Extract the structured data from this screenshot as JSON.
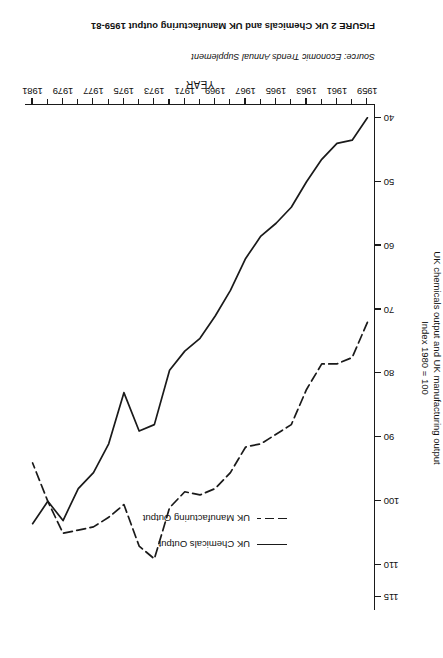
{
  "figure": {
    "source_label": "Source:",
    "source_text": "Economic Trends Annual Supplement",
    "caption": "FIGURE 2  UK Chemicals and UK Manufacturing output 1959-81"
  },
  "legend": {
    "items": [
      {
        "label": "UK Chemicals Output",
        "style": "solid"
      },
      {
        "label": "UK Manufacturing Output",
        "style": "dashed"
      }
    ]
  },
  "axes": {
    "x_title": "YEAR",
    "y_title_line1": "UK chemicals output and UK manufacturing output",
    "y_title_line2": "Index 1980 = 100",
    "y_ticks": [
      "40",
      "50",
      "60",
      "70",
      "80",
      "90",
      "100",
      "110",
      "115"
    ],
    "x_ticks": [
      "1959",
      "1961",
      "1963",
      "1965",
      "1967",
      "1969",
      "1971",
      "1973",
      "1975",
      "1977",
      "1979",
      "1981"
    ]
  },
  "chart_data": {
    "type": "line",
    "title": "UK Chemicals and UK Manufacturing output 1959-81",
    "xlabel": "YEAR",
    "ylabel": "UK chemicals output and UK manufacturing output, Index 1980 = 100",
    "xlim": [
      1958.5,
      1981.5
    ],
    "ylim": [
      38,
      117
    ],
    "grid": false,
    "legend_position": "upper-left-inside",
    "x": [
      1959,
      1960,
      1961,
      1962,
      1963,
      1964,
      1965,
      1966,
      1967,
      1968,
      1969,
      1970,
      1971,
      1972,
      1973,
      1974,
      1975,
      1976,
      1977,
      1978,
      1979,
      1980,
      1981
    ],
    "series": [
      {
        "name": "UK Chemicals Output",
        "style": "solid",
        "color": "#1a1a1a",
        "values": [
          40.0,
          43.5,
          44.0,
          46.5,
          50.0,
          54.0,
          56.5,
          58.5,
          62.0,
          67.0,
          71.0,
          74.5,
          76.5,
          79.5,
          88.0,
          89.0,
          83.0,
          91.0,
          95.5,
          98.0,
          103.0,
          100.0,
          103.5
        ]
      },
      {
        "name": "UK Manufacturing Output",
        "style": "dashed",
        "color": "#1a1a1a",
        "values": [
          72.0,
          77.5,
          78.5,
          78.5,
          82.5,
          88.0,
          89.5,
          91.0,
          91.5,
          95.5,
          98.0,
          99.0,
          98.5,
          101.0,
          109.0,
          107.0,
          100.5,
          102.5,
          104.0,
          104.5,
          105.0,
          100.0,
          94.0
        ]
      }
    ],
    "annotations": [
      {
        "text": "Peak in both series at 1973-74",
        "x": 1973.5
      },
      {
        "text": "Trough at 1975 recession",
        "x": 1975
      }
    ]
  }
}
